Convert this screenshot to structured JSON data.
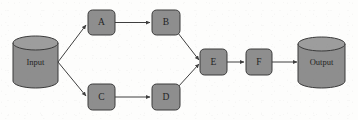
{
  "diagram": {
    "background_color": "#fdfdfc",
    "node_fill": "#8e8e8e",
    "node_stroke": "#3a3a3a",
    "edge_color": "#3f3f3f",
    "label_color": "#242424",
    "nodes": [
      {
        "id": "input",
        "label": "Input",
        "shape": "cylinder",
        "x": 13,
        "y": 36,
        "w": 45,
        "h": 52
      },
      {
        "id": "a",
        "label": "A",
        "shape": "rounded-rect",
        "x": 88,
        "y": 10,
        "w": 27,
        "h": 25
      },
      {
        "id": "b",
        "label": "B",
        "shape": "rounded-rect",
        "x": 152,
        "y": 10,
        "w": 28,
        "h": 25
      },
      {
        "id": "c",
        "label": "C",
        "shape": "rounded-rect",
        "x": 88,
        "y": 84,
        "w": 27,
        "h": 26
      },
      {
        "id": "d",
        "label": "D",
        "shape": "rounded-rect",
        "x": 152,
        "y": 84,
        "w": 28,
        "h": 26
      },
      {
        "id": "e",
        "label": "E",
        "shape": "rounded-rect",
        "x": 200,
        "y": 49,
        "w": 27,
        "h": 26
      },
      {
        "id": "f",
        "label": "F",
        "shape": "rounded-rect",
        "x": 246,
        "y": 49,
        "w": 26,
        "h": 26
      },
      {
        "id": "output",
        "label": "Output",
        "shape": "cylinder",
        "x": 298,
        "y": 37,
        "w": 47,
        "h": 51
      }
    ],
    "edges": [
      {
        "from": "input",
        "to": "a",
        "style": "straight-arrow"
      },
      {
        "from": "input",
        "to": "c",
        "style": "straight-arrow"
      },
      {
        "from": "a",
        "to": "b",
        "style": "straight-arrow"
      },
      {
        "from": "c",
        "to": "d",
        "style": "straight-arrow"
      },
      {
        "from": "b",
        "to": "e",
        "style": "straight-arrow"
      },
      {
        "from": "d",
        "to": "e",
        "style": "straight-arrow"
      },
      {
        "from": "e",
        "to": "f",
        "style": "straight-arrow"
      },
      {
        "from": "f",
        "to": "output",
        "style": "straight-arrow"
      }
    ]
  }
}
